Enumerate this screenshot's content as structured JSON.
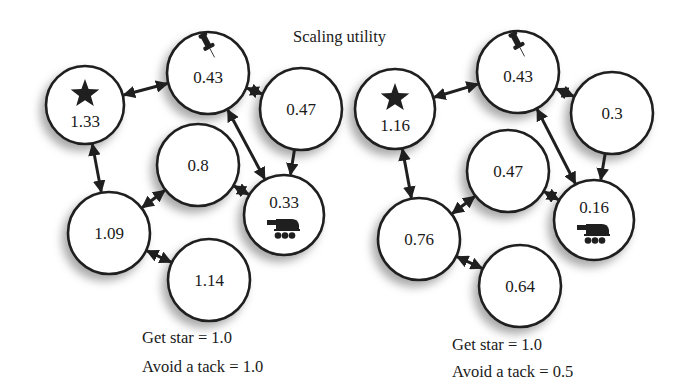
{
  "title": "Scaling utility",
  "colors": {
    "ink": "#1f1f1f",
    "background": "#ffffff",
    "shadow": "#9a9a9a"
  },
  "panels": [
    {
      "id": "left",
      "caption": {
        "get_star": "Get star = 1.0",
        "avoid_tack": "Avoid a tack = 1.0"
      },
      "caption_pos": {
        "x": 142,
        "y1": 343,
        "y2": 372
      },
      "nodes": [
        {
          "id": "star",
          "value": "1.33",
          "icon": "star-icon",
          "cx": 85,
          "cy": 105,
          "r": 39
        },
        {
          "id": "tack",
          "value": "0.43",
          "icon": "pushpin-icon",
          "cx": 208,
          "cy": 73,
          "r": 41
        },
        {
          "id": "n047",
          "value": "0.47",
          "icon": "",
          "cx": 301,
          "cy": 109,
          "r": 41
        },
        {
          "id": "n08",
          "value": "0.8",
          "icon": "",
          "cx": 198,
          "cy": 165,
          "r": 41
        },
        {
          "id": "robot",
          "value": "0.33",
          "icon": "robot-icon",
          "cx": 284,
          "cy": 215,
          "r": 40
        },
        {
          "id": "n109",
          "value": "1.09",
          "icon": "",
          "cx": 109,
          "cy": 233,
          "r": 41
        },
        {
          "id": "n114",
          "value": "1.14",
          "icon": "",
          "cx": 209,
          "cy": 280,
          "r": 41
        }
      ]
    },
    {
      "id": "right",
      "caption": {
        "get_star": "Get star = 1.0",
        "avoid_tack": "Avoid a tack = 0.5"
      },
      "caption_pos": {
        "x": 452,
        "y1": 350,
        "y2": 377
      },
      "nodes": [
        {
          "id": "star",
          "value": "1.16",
          "icon": "star-icon",
          "cx": 395,
          "cy": 109,
          "r": 40
        },
        {
          "id": "tack",
          "value": "0.43",
          "icon": "pushpin-icon",
          "cx": 518,
          "cy": 72,
          "r": 41
        },
        {
          "id": "n03",
          "value": "0.3",
          "icon": "",
          "cx": 612,
          "cy": 113,
          "r": 41
        },
        {
          "id": "n047",
          "value": "0.47",
          "icon": "",
          "cx": 508,
          "cy": 171,
          "r": 41
        },
        {
          "id": "robot",
          "value": "0.16",
          "icon": "robot-icon",
          "cx": 594,
          "cy": 220,
          "r": 40
        },
        {
          "id": "n076",
          "value": "0.76",
          "icon": "",
          "cx": 419,
          "cy": 239,
          "r": 41
        },
        {
          "id": "n064",
          "value": "0.64",
          "icon": "",
          "cx": 520,
          "cy": 286,
          "r": 41
        }
      ]
    }
  ],
  "edges": [
    {
      "from": "tack",
      "to": "star",
      "arrows": "both"
    },
    {
      "from": "tack",
      "to": "n047|n03",
      "arrows": "both"
    },
    {
      "from": "n047|n03",
      "to": "robot",
      "arrows": "end"
    },
    {
      "from": "tack",
      "to": "robot",
      "arrows": "both"
    },
    {
      "from": "mid",
      "to": "robot",
      "arrows": "both"
    },
    {
      "from": "star",
      "to": "low",
      "arrows": "both"
    },
    {
      "from": "mid",
      "to": "low",
      "arrows": "both"
    },
    {
      "from": "low",
      "to": "bottom",
      "arrows": "both"
    }
  ]
}
